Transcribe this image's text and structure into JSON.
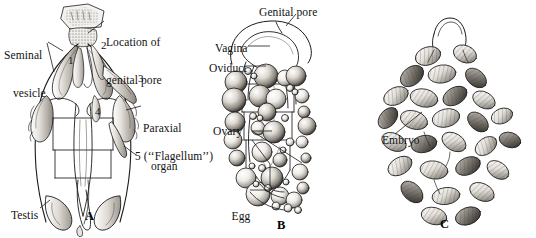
{
  "figure": {
    "width": 536,
    "height": 238,
    "background": "#ffffff",
    "ink": "#1a1a1a",
    "fill_light": "#f2f0ec",
    "fill_mid": "#cfcac2",
    "fill_dark": "#6e6a64"
  },
  "panels": [
    {
      "id": "A",
      "letter": "A",
      "caption": "Male reproductive system",
      "letter_pos": {
        "x": 85,
        "y": 210
      }
    },
    {
      "id": "B",
      "letter": "B",
      "caption": "Female reproductive system with egg follicles",
      "letter_pos": {
        "x": 277,
        "y": 219
      }
    },
    {
      "id": "C",
      "letter": "C",
      "caption": "Embryo mass",
      "letter_pos": {
        "x": 440,
        "y": 218
      }
    }
  ],
  "labels": [
    {
      "name": "seminal-vesicle",
      "lines": [
        "Seminal",
        "vesicle"
      ],
      "text": "Seminal vesicle",
      "x": 4,
      "y": 24,
      "panel": "A"
    },
    {
      "name": "location-of-genital-pore",
      "lines": [
        "Location of",
        "genital pore"
      ],
      "text": "Location of genital pore",
      "x": 106,
      "y": 12,
      "panel": "A"
    },
    {
      "name": "paraxial-organ",
      "lines": [
        "Paraxial",
        "organ"
      ],
      "text": "Paraxial organ",
      "x": 143,
      "y": 97,
      "panel": "A"
    },
    {
      "name": "flagellum",
      "lines": [
        "5 (‘‘Flagellum’’)"
      ],
      "text": "5 (‘‘Flagellum’’)",
      "x": 138,
      "y": 152,
      "panel": "A"
    },
    {
      "name": "testis",
      "lines": [
        "Testis"
      ],
      "text": "Testis",
      "x": 11,
      "y": 210,
      "panel": "A"
    },
    {
      "name": "genital-pore",
      "lines": [
        "Genital pore"
      ],
      "text": "Genital pore",
      "x": 262,
      "y": 8,
      "panel": "B"
    },
    {
      "name": "vagina",
      "lines": [
        "Vagina"
      ],
      "text": "Vagina",
      "x": 215,
      "y": 43,
      "panel": "B"
    },
    {
      "name": "oviduct",
      "lines": [
        "Oviduct"
      ],
      "text": "Oviduct",
      "x": 209,
      "y": 63,
      "panel": "B"
    },
    {
      "name": "ovary",
      "lines": [
        "Ovary"
      ],
      "text": "Ovary",
      "x": 214,
      "y": 127,
      "panel": "B"
    },
    {
      "name": "egg-follicles",
      "lines": [
        "Egg",
        "follicles"
      ],
      "text": "Egg follicles",
      "x": 213,
      "y": 186,
      "panel": "B"
    },
    {
      "name": "embryo",
      "lines": [
        "Embryo"
      ],
      "text": "Embryo",
      "x": 382,
      "y": 135,
      "panel": "C"
    }
  ],
  "numbered_callouts": [
    {
      "name": "callout-1",
      "value": "1",
      "x": 68,
      "y": 58,
      "panel": "A"
    },
    {
      "name": "callout-2",
      "value": "2",
      "x": 101,
      "y": 42,
      "panel": "A"
    },
    {
      "name": "callout-3",
      "value": "3",
      "x": 138,
      "y": 76,
      "panel": "A"
    },
    {
      "name": "callout-4",
      "value": "4",
      "x": 95,
      "y": 108,
      "panel": "A"
    },
    {
      "name": "callout-5",
      "value": "5",
      "x": 138,
      "y": 152,
      "panel": "A"
    }
  ]
}
